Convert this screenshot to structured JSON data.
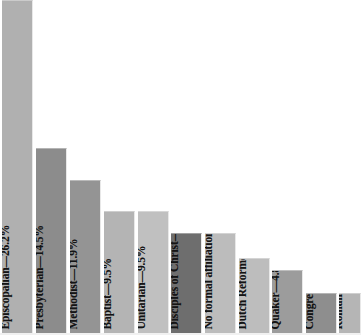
{
  "chart_data": {
    "type": "bar",
    "title": "",
    "subtitle": "",
    "xlabel": "",
    "ylabel": "",
    "ylim": [
      0,
      26.2
    ],
    "grid": false,
    "legend": false,
    "orientation": "vertical",
    "value_unit": "%",
    "label_format": "{category}—{value}%",
    "categories": [
      "Episcopalian",
      "Presbyterian",
      "Methodist",
      "Baptist",
      "Unitarian",
      "Disciples of Christ",
      "No formal affiliation",
      "Dutch Reformed",
      "Quaker",
      "Congregationalist",
      "Roman Catholic"
    ],
    "values": [
      26.2,
      14.5,
      11.9,
      9.5,
      9.5,
      7.1,
      7.1,
      4.8,
      4.8,
      2.4,
      2.4
    ],
    "bars": [
      {
        "category": "Episcopalian",
        "value": 26.2,
        "label": "Episcopalian—26.2%",
        "color": "#b0b0b0",
        "x": 2,
        "width": 31,
        "top": 0
      },
      {
        "category": "Presbyterian",
        "value": 14.5,
        "label": "Presbyterian—14.5%",
        "color": "#8c8c8c",
        "x": 36,
        "width": 31,
        "top": 148
      },
      {
        "category": "Methodist",
        "value": 11.9,
        "label": "Methodist—11.9%",
        "color": "#949494",
        "x": 70,
        "width": 31,
        "top": 180
      },
      {
        "category": "Baptist",
        "value": 9.5,
        "label": "Baptist—9.5%",
        "color": "#b4b4b4",
        "x": 104,
        "width": 31,
        "top": 211
      },
      {
        "category": "Unitarian",
        "value": 9.5,
        "label": "Unitarian—9.5%",
        "color": "#c0c0c0",
        "x": 138,
        "width": 31,
        "top": 211
      },
      {
        "category": "Disciples of Christ",
        "value": 7.1,
        "label": "Disciples of Christ—7.1%",
        "color": "#6e6e6e",
        "x": 171,
        "width": 31,
        "top": 233
      },
      {
        "category": "No formal affiliation",
        "value": 7.1,
        "label": "No formal affiliation—7.1%",
        "color": "#bcbcbc",
        "x": 205,
        "width": 31,
        "top": 233
      },
      {
        "category": "Dutch Reformed",
        "value": 4.8,
        "label": "Dutch Reformed—4.8%",
        "color": "#bdbdbd",
        "x": 239,
        "width": 31,
        "top": 258
      },
      {
        "category": "Quaker",
        "value": 4.8,
        "label": "Quaker—4.8%",
        "color": "#9c9c9c",
        "x": 272,
        "width": 31,
        "top": 270
      },
      {
        "category": "Congregationalist",
        "value": 2.4,
        "label": "Congregationalist—2.4%",
        "color": "#8e8e8e",
        "x": 306,
        "width": 31,
        "top": 293
      },
      {
        "category": "Roman Catholic",
        "value": 2.4,
        "label": "Roman Catholic—2.4%",
        "color": "#b5b5b5",
        "x": 339,
        "width": 22,
        "top": 293
      }
    ]
  }
}
